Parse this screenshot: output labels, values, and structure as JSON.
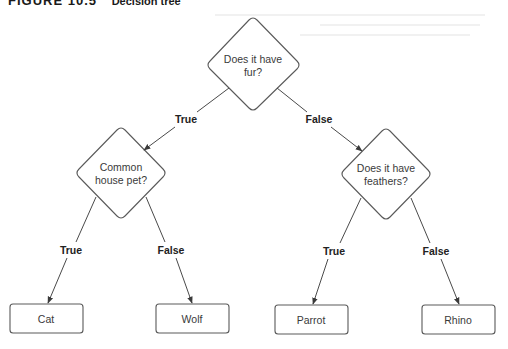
{
  "caption": {
    "figure_number": "FIGURE 10.5",
    "title": "Decision tree"
  },
  "root": {
    "question_line1": "Does it have",
    "question_line2": "fur?"
  },
  "edges_level1": {
    "left_label": "True",
    "right_label": "False"
  },
  "left_node": {
    "question_line1": "Common",
    "question_line2": "house pet?",
    "true_label": "True",
    "false_label": "False"
  },
  "right_node": {
    "question_line1": "Does it have",
    "question_line2": "feathers?",
    "true_label": "True",
    "false_label": "False"
  },
  "leaves": {
    "cat": "Cat",
    "wolf": "Wolf",
    "parrot": "Parrot",
    "rhino": "Rhino"
  },
  "colors": {
    "stroke": "#5a5a5a",
    "text": "#3a3a3a",
    "label": "#222222"
  }
}
